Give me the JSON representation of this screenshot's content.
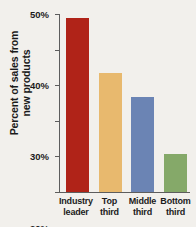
{
  "chart_data": {
    "type": "bar",
    "title": "",
    "xlabel": "",
    "ylabel": "Percent of sales from new products",
    "ylabel_lines": [
      "Percent of sales from",
      "new products"
    ],
    "categories": [
      "Industry leader",
      "Top third",
      "Middle third",
      "Bottom third"
    ],
    "category_lines": [
      [
        "Industry",
        "leader"
      ],
      [
        "Top",
        "third"
      ],
      [
        "Middle",
        "third"
      ],
      [
        "Bottom",
        "third"
      ]
    ],
    "values": [
      49,
      33.5,
      26.8,
      10.6
    ],
    "value_labels": [
      "49%",
      "33.5%",
      "26.8%",
      "10.6%"
    ],
    "ylim": [
      0,
      50
    ],
    "ytick_values": [
      0,
      10,
      20,
      30,
      40,
      50
    ],
    "ytick_labels": [
      "0%",
      "10%",
      "20%",
      "30%",
      "40%",
      "50%"
    ],
    "grid": false,
    "legend": false,
    "bar_colors": [
      "#b02318",
      "#e8b96e",
      "#6b84b4",
      "#85a969"
    ],
    "background_color": "#f2f0ec",
    "axis_color": "#5d5d5d",
    "text_color": "#1b1b1b"
  }
}
